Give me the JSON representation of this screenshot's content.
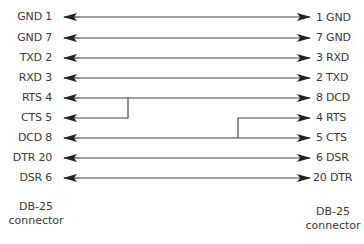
{
  "diagram": {
    "left_connector": {
      "caption_line1": "DB-25",
      "caption_line2": "connector",
      "pins": [
        {
          "label": "GND 1"
        },
        {
          "label": "GND 7"
        },
        {
          "label": "TXD 2"
        },
        {
          "label": "RXD 3"
        },
        {
          "label": "RTS 4"
        },
        {
          "label": "CTS 5"
        },
        {
          "label": "DCD 8"
        },
        {
          "label": "DTR 20"
        },
        {
          "label": "DSR 6"
        }
      ]
    },
    "right_connector": {
      "caption_line1": "DB-25",
      "caption_line2": "connector",
      "pins": [
        {
          "label": "1 GND"
        },
        {
          "label": "7 GND"
        },
        {
          "label": "3 RXD"
        },
        {
          "label": "2 TXD"
        },
        {
          "label": "8 DCD"
        },
        {
          "label": "4 RTS"
        },
        {
          "label": "5 CTS"
        },
        {
          "label": "6 DSR"
        },
        {
          "label": "20 DTR"
        }
      ]
    },
    "connections": [
      {
        "from": "GND 1",
        "to": "1 GND"
      },
      {
        "from": "GND 7",
        "to": "7 GND"
      },
      {
        "from": "TXD 2",
        "to": "3 RXD"
      },
      {
        "from": "RXD 3",
        "to": "2 TXD"
      },
      {
        "from": "RTS 4 + CTS 5",
        "to": "8 DCD"
      },
      {
        "from": "DCD 8",
        "to": "4 RTS + 5 CTS"
      },
      {
        "from": "DTR 20",
        "to": "6 DSR"
      },
      {
        "from": "DSR 6",
        "to": "20 DTR"
      }
    ],
    "line_color": "#333333"
  }
}
